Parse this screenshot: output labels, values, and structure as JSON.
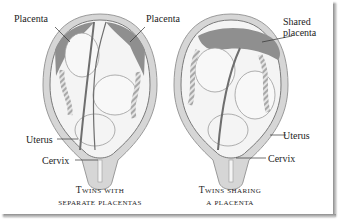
{
  "diagrams": [
    {
      "id": "separate",
      "labels": {
        "placenta_left": "Placenta",
        "placenta_right": "Placenta",
        "uterus": "Uterus",
        "cervix": "Cervix"
      },
      "caption_line1": "Twins with",
      "caption_line2": "separate placentas"
    },
    {
      "id": "shared",
      "labels": {
        "shared_placenta_line1": "Shared",
        "shared_placenta_line2": "placenta",
        "uterus": "Uterus",
        "cervix": "Cervix"
      },
      "caption_line1": "Twins sharing",
      "caption_line2": "a placenta"
    }
  ],
  "colors": {
    "uterus_wall": "#d6d6d6",
    "uterus_outline": "#9a9a9a",
    "placenta": "#8f8f8f",
    "fetus_fill": "#f2f2f2",
    "membrane": "#6e6e6e",
    "text": "#1c1c1c"
  }
}
